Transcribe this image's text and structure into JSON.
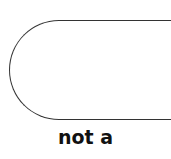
{
  "diagram": {
    "shape": {
      "type": "terminator",
      "text": ""
    },
    "label_line1": "not a",
    "label_line2": "...",
    "stroke_color": "#333333"
  }
}
